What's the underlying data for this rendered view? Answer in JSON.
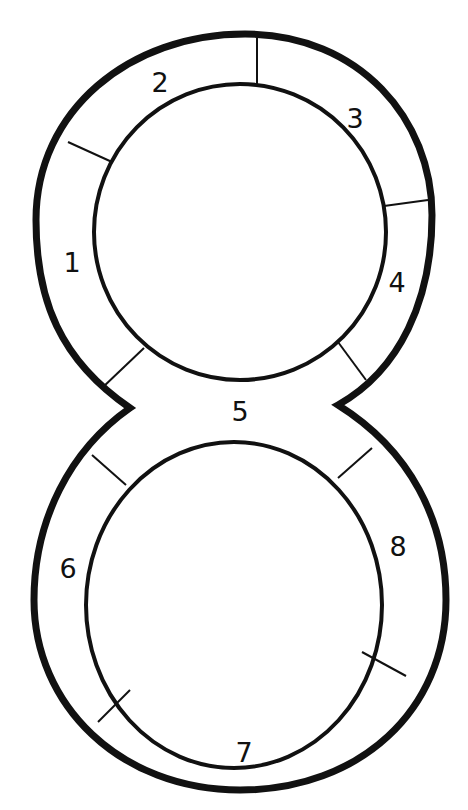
{
  "diagram": {
    "type": "figure-eight-track",
    "colors": {
      "background": "#ffffff",
      "ink": "#111111"
    },
    "segments": [
      {
        "id": 1,
        "label": "1",
        "x": 72,
        "y": 262
      },
      {
        "id": 2,
        "label": "2",
        "x": 160,
        "y": 90
      },
      {
        "id": 3,
        "label": "3",
        "x": 355,
        "y": 125
      },
      {
        "id": 4,
        "label": "4",
        "x": 397,
        "y": 290
      },
      {
        "id": 5,
        "label": "5",
        "x": 240,
        "y": 420
      },
      {
        "id": 6,
        "label": "6",
        "x": 68,
        "y": 578
      },
      {
        "id": 7,
        "label": "7",
        "x": 244,
        "y": 760
      },
      {
        "id": 8,
        "label": "8",
        "x": 398,
        "y": 555
      }
    ]
  }
}
